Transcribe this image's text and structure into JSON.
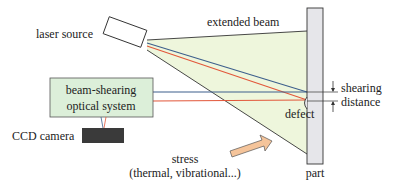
{
  "diagram": {
    "labels": {
      "laser_source": "laser source",
      "extended_beam": "extended beam",
      "beam_shearing_line1": "beam-shearing",
      "beam_shearing_line2": "optical system",
      "ccd_camera": "CCD camera",
      "shearing_line1": "shearing",
      "shearing_line2": "distance",
      "defect": "defect",
      "stress_line1": "stress",
      "stress_line2": "(thermal, vibrational...)",
      "part": "part"
    },
    "colors": {
      "beam_fill": "#eef6dc",
      "box_fill": "#dcefd9",
      "part_fill": "#e6e6ea",
      "camera_fill": "#3a3a3a",
      "blue_ray": "#3d5f8c",
      "red_ray": "#e2573a",
      "arrow_fill": "#f5c49a",
      "outline": "#333333"
    }
  }
}
